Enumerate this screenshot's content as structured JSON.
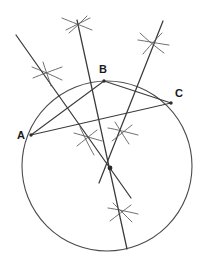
{
  "diagram": {
    "type": "geometric-construction",
    "canvas": {
      "width": 208,
      "height": 268,
      "background": "#ffffff"
    },
    "colors": {
      "circle": "#4a4a4a",
      "chord": "#3c3c3c",
      "bisector": "#3a3a3a",
      "arc_mark": "#555555",
      "label": "#1a1a1a",
      "background": "#ffffff"
    },
    "circumcircle": {
      "cx": 107,
      "cy": 166,
      "r": 85
    },
    "circumcenter": {
      "x": 110,
      "y": 168
    },
    "points": [
      {
        "id": "A",
        "label": "A",
        "x": 31,
        "y": 135,
        "label_x": 17,
        "label_y": 130
      },
      {
        "id": "B",
        "label": "B",
        "x": 104,
        "y": 81,
        "label_x": 99,
        "label_y": 64
      },
      {
        "id": "C",
        "label": "C",
        "x": 171,
        "y": 103,
        "label_x": 175,
        "label_y": 88
      }
    ],
    "chords": [
      {
        "id": "AB",
        "from": "A",
        "to": "B"
      },
      {
        "id": "BC",
        "from": "B",
        "to": "C"
      },
      {
        "id": "AC",
        "from": "A",
        "to": "C"
      }
    ],
    "bisectors": [
      {
        "id": "bisector-AB",
        "x1": 16,
        "y1": 35,
        "x2": 131,
        "y2": 198
      },
      {
        "id": "bisector-AC",
        "x1": 77,
        "y1": 20,
        "x2": 127,
        "y2": 249
      },
      {
        "id": "bisector-BC",
        "x1": 163,
        "y1": 21,
        "x2": 99,
        "y2": 183
      }
    ],
    "arc_marks": [
      {
        "id": "arc-cross-upper-left",
        "x": 47,
        "y": 73
      },
      {
        "id": "arc-cross-top",
        "x": 77,
        "y": 24
      },
      {
        "id": "arc-cross-upper-right",
        "x": 152,
        "y": 43
      },
      {
        "id": "arc-cross-lower-left",
        "x": 88,
        "y": 138
      },
      {
        "id": "arc-cross-lower-right",
        "x": 122,
        "y": 132
      },
      {
        "id": "arc-cross-bottom",
        "x": 122,
        "y": 212
      }
    ]
  }
}
